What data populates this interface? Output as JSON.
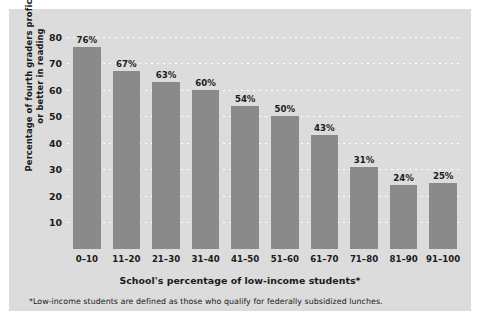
{
  "chart_data": {
    "type": "bar",
    "title": "",
    "xlabel": "School's percentage of low-income students*",
    "ylabel": "Percentage of fourth graders proficient or better in reading",
    "categories": [
      "0–10",
      "11–20",
      "21–30",
      "31–40",
      "41–50",
      "51–60",
      "61–70",
      "71–80",
      "81–90",
      "91–100"
    ],
    "values": [
      76,
      67,
      63,
      60,
      54,
      50,
      43,
      31,
      24,
      25
    ],
    "value_labels": [
      "76%",
      "67%",
      "63%",
      "60%",
      "54%",
      "50%",
      "43%",
      "31%",
      "24%",
      "25%"
    ],
    "yticks": [
      10,
      20,
      30,
      40,
      50,
      60,
      70,
      80
    ],
    "ytick_labels": [
      "10",
      "20",
      "30",
      "40",
      "50",
      "60",
      "70",
      "80"
    ],
    "ylim": [
      0,
      84
    ],
    "grid": "horizontal-dotted",
    "legend": "none",
    "annotations": [
      "*Low-income students are defined as those who qualify for federally subsidized lunches."
    ]
  },
  "footnote": "*Low-income students are defined as those who qualify for federally subsidized lunches.",
  "colors": {
    "bar": "#8a8a8a",
    "panel": "#dcdcdc",
    "page": "#ffffff",
    "grid": "#ffffff",
    "text": "#1a1a1a"
  }
}
